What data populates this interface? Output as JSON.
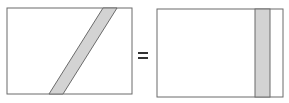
{
  "diagram": {
    "equals_symbol": "=",
    "colors": {
      "background": "#ffffff",
      "outline": "#6b6b6b",
      "strip_fill": "#d3d3d3"
    },
    "left_panel": {
      "shape": "rectangle",
      "strip": "slanted parallelogram"
    },
    "right_panel": {
      "shape": "rectangle",
      "strip": "vertical rectangle"
    }
  }
}
